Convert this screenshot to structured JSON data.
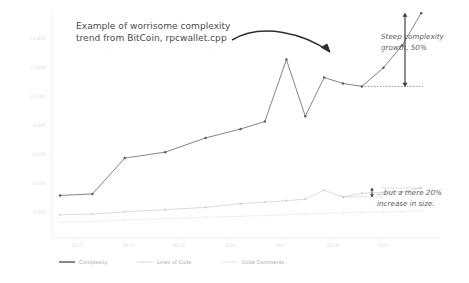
{
  "chart_data": {
    "type": "line",
    "title": "Example of worrisome complexity trend from BitCoin, rpcwallet.cpp",
    "xlabel": "",
    "ylabel": "",
    "grid": false,
    "legend_position": "bottom",
    "x": [
      "2013",
      "2014",
      "2015",
      "2016",
      "2017",
      "2018",
      "2019"
    ],
    "xlim": [
      2012.6,
      2019.8
    ],
    "ylim": [
      0,
      15000
    ],
    "yticks": [
      2000,
      4000,
      6000,
      8000,
      10000,
      12000,
      14000
    ],
    "ytick_labels": [
      "2,000",
      "4,000",
      "6,000",
      "8,000",
      "10,000",
      "12,000",
      "14,000"
    ],
    "xtick_labels": [
      "2013",
      "2014",
      "2015",
      "2016",
      "2017",
      "2018",
      "2019"
    ],
    "series": [
      {
        "name": "Complexity",
        "color": "#6e6e74",
        "points": [
          {
            "x": 2012.75,
            "y": 2850
          },
          {
            "x": 2013.35,
            "y": 2950
          },
          {
            "x": 2013.95,
            "y": 5350
          },
          {
            "x": 2014.7,
            "y": 5750
          },
          {
            "x": 2015.45,
            "y": 6700
          },
          {
            "x": 2016.1,
            "y": 7300
          },
          {
            "x": 2016.55,
            "y": 7800
          },
          {
            "x": 2016.95,
            "y": 11950
          },
          {
            "x": 2017.3,
            "y": 8150
          },
          {
            "x": 2017.65,
            "y": 10750
          },
          {
            "x": 2018.0,
            "y": 10350
          },
          {
            "x": 2018.35,
            "y": 10150
          },
          {
            "x": 2018.75,
            "y": 11400
          },
          {
            "x": 2019.1,
            "y": 12900
          },
          {
            "x": 2019.45,
            "y": 15050
          }
        ]
      },
      {
        "name": "Lines of Code",
        "color": "#d2d2d6",
        "points": [
          {
            "x": 2012.75,
            "y": 1550
          },
          {
            "x": 2013.35,
            "y": 1600
          },
          {
            "x": 2013.95,
            "y": 1750
          },
          {
            "x": 2014.7,
            "y": 1900
          },
          {
            "x": 2015.45,
            "y": 2050
          },
          {
            "x": 2016.1,
            "y": 2300
          },
          {
            "x": 2016.55,
            "y": 2400
          },
          {
            "x": 2016.95,
            "y": 2500
          },
          {
            "x": 2017.3,
            "y": 2600
          },
          {
            "x": 2017.65,
            "y": 3200
          },
          {
            "x": 2018.0,
            "y": 2750
          },
          {
            "x": 2018.35,
            "y": 3000
          },
          {
            "x": 2018.75,
            "y": 3050
          },
          {
            "x": 2019.1,
            "y": 3100
          },
          {
            "x": 2019.45,
            "y": 3350
          }
        ]
      },
      {
        "name": "Code Comments",
        "color": "#ececee",
        "points": [
          {
            "x": 2012.75,
            "y": 1050
          },
          {
            "x": 2013.35,
            "y": 1100
          },
          {
            "x": 2013.95,
            "y": 1200
          },
          {
            "x": 2014.7,
            "y": 1300
          },
          {
            "x": 2015.45,
            "y": 1400
          },
          {
            "x": 2016.1,
            "y": 1450
          },
          {
            "x": 2016.55,
            "y": 1500
          },
          {
            "x": 2016.95,
            "y": 1550
          },
          {
            "x": 2017.3,
            "y": 1600
          },
          {
            "x": 2017.65,
            "y": 1650
          },
          {
            "x": 2018.0,
            "y": 1700
          },
          {
            "x": 2018.35,
            "y": 1720
          },
          {
            "x": 2018.75,
            "y": 1740
          },
          {
            "x": 2019.1,
            "y": 1760
          },
          {
            "x": 2019.45,
            "y": 1800
          }
        ]
      }
    ],
    "annotations": [
      {
        "id": "title",
        "text": "Example of worrisome complexity trend from BitCoin, rpcwallet.cpp"
      },
      {
        "id": "growth",
        "text": "Steep complexity growth, 50%"
      },
      {
        "id": "size",
        "text": "...but a mere 20% increase in size."
      }
    ]
  },
  "title": {
    "line1": "Example of worrisome complexity",
    "line2": "trend from BitCoin, rpcwallet.cpp"
  },
  "annotations": {
    "growth": {
      "line1": "Steep complexity",
      "line2": "growth, 50%"
    },
    "size": {
      "line1": "...but a mere 20%",
      "line2": "increase in size."
    }
  },
  "legend": {
    "items": [
      {
        "label": "Complexity",
        "color": "#5e5e64"
      },
      {
        "label": "Lines of Code",
        "color": "#dcdce0"
      },
      {
        "label": "Code Comments",
        "color": "#e6e6e9"
      }
    ]
  },
  "axes": {
    "y_labels": [
      "14,000",
      "12,000",
      "10,000",
      "8,000",
      "6,000",
      "4,000",
      "2,000"
    ],
    "x_labels": [
      "2013",
      "2014",
      "2015",
      "2016",
      "2017",
      "2018",
      "2019"
    ]
  }
}
